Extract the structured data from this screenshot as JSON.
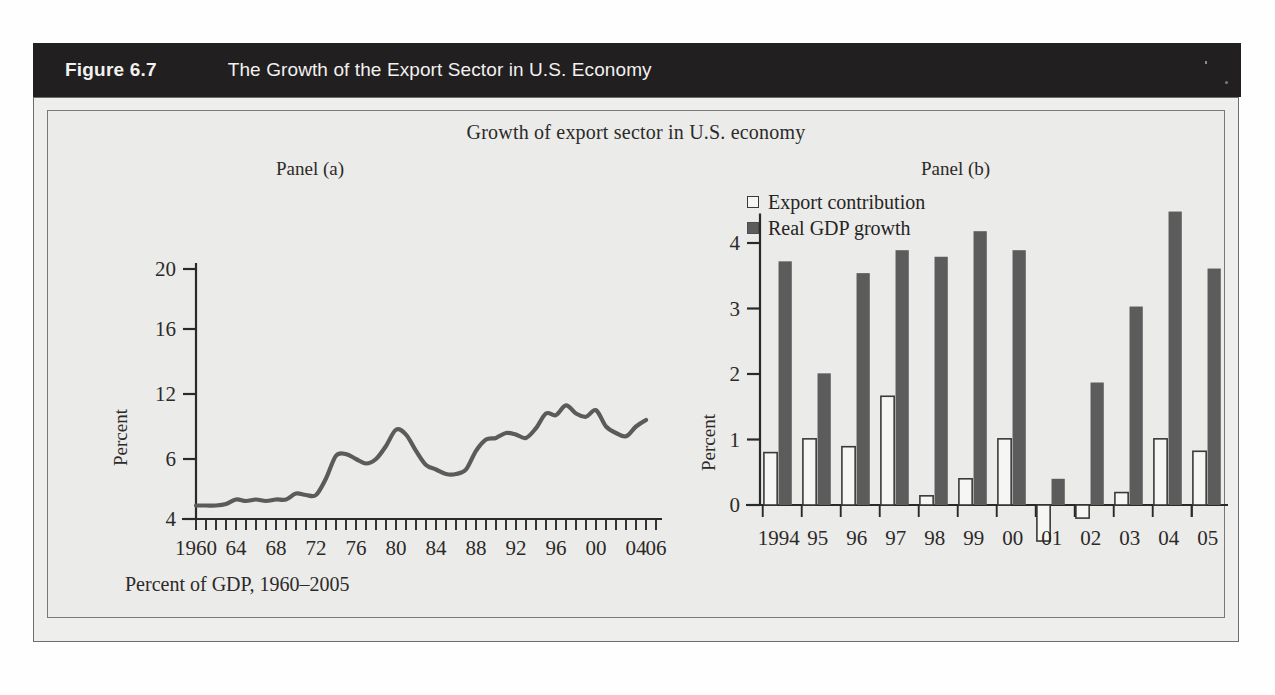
{
  "header": {
    "figure_number": "Figure 6.7",
    "title": "The Growth of the Export Sector in U.S. Economy"
  },
  "chart_title": "Growth of export sector in U.S. economy",
  "panel_a": {
    "label": "Panel (a)",
    "ylabel": "Percent",
    "caption": "Percent of GDP, 1960–2005"
  },
  "panel_b": {
    "label": "Panel (b)",
    "ylabel": "Percent",
    "legend": [
      {
        "label": "Export contribution",
        "swatch": "open-square",
        "color": "#f6f6f4"
      },
      {
        "label": "Real GDP growth",
        "swatch": "filled-square",
        "color": "#5c5c5c"
      }
    ]
  },
  "colors": {
    "header_bg": "#211f20",
    "header_text": "#f2f1ef",
    "panel_bg": "#eeeeec",
    "inner_bg": "#ebebe9",
    "frame": "#6c6d6f",
    "line": "#5b5b5b",
    "bar_dark": "#5c5c5c",
    "bar_open_fill": "#f6f6f4",
    "bar_open_stroke": "#3a3a38",
    "axis": "#2b2a28"
  },
  "chart_data": [
    {
      "type": "line",
      "title": "Panel (a) — Exports as percent of GDP",
      "xlabel": "",
      "ylabel": "Percent",
      "subcaption": "Percent of GDP, 1960–2005",
      "grid": false,
      "legend_position": "none",
      "xlim": [
        1960,
        2006
      ],
      "ylim": [
        4,
        20
      ],
      "ytick_labels": [
        "4",
        "6",
        "12",
        "16",
        "20"
      ],
      "ytick_values": [
        4,
        8,
        12,
        16,
        20
      ],
      "xtick_labels": [
        "1960",
        "64",
        "68",
        "72",
        "76",
        "80",
        "84",
        "88",
        "92",
        "96",
        "00",
        "04",
        "06"
      ],
      "xtick_values": [
        1960,
        1964,
        1968,
        1972,
        1976,
        1980,
        1984,
        1988,
        1992,
        1996,
        2000,
        2004,
        2006
      ],
      "minor_xticks_every": 1,
      "series": [
        {
          "name": "Exports as % of GDP",
          "x": [
            1960,
            1961,
            1962,
            1963,
            1964,
            1965,
            1966,
            1967,
            1968,
            1969,
            1970,
            1971,
            1972,
            1973,
            1974,
            1975,
            1976,
            1977,
            1978,
            1979,
            1980,
            1981,
            1982,
            1983,
            1984,
            1985,
            1986,
            1987,
            1988,
            1989,
            1990,
            1991,
            1992,
            1993,
            1994,
            1995,
            1996,
            1997,
            1998,
            1999,
            2000,
            2001,
            2002,
            2003,
            2004,
            2005
          ],
          "values": [
            4.9,
            4.9,
            4.9,
            5.0,
            5.3,
            5.2,
            5.3,
            5.2,
            5.3,
            5.3,
            5.7,
            5.6,
            5.6,
            6.7,
            8.2,
            8.3,
            8.0,
            7.7,
            8.0,
            8.8,
            9.8,
            9.5,
            8.5,
            7.6,
            7.3,
            7.0,
            7.0,
            7.3,
            8.5,
            9.2,
            9.3,
            9.6,
            9.5,
            9.3,
            9.9,
            10.8,
            10.7,
            11.3,
            10.8,
            10.6,
            11.0,
            10.0,
            9.6,
            9.4,
            10.0,
            10.4
          ]
        }
      ]
    },
    {
      "type": "bar",
      "title": "Panel (b) — Export contribution and real GDP growth",
      "xlabel": "",
      "ylabel": "Percent",
      "grid": false,
      "legend_position": "top-left",
      "ylim": [
        -0.7,
        4.6
      ],
      "ytick_labels": [
        "0",
        "1",
        "2",
        "3",
        "4"
      ],
      "ytick_values": [
        0,
        1,
        2,
        3,
        4
      ],
      "categories": [
        "1994",
        "95",
        "96",
        "97",
        "98",
        "99",
        "00",
        "01",
        "02",
        "03",
        "04",
        "05"
      ],
      "series": [
        {
          "name": "Export contribution",
          "style": "open",
          "values": [
            0.8,
            1.01,
            0.89,
            1.66,
            0.14,
            0.4,
            1.01,
            -0.55,
            -0.2,
            0.19,
            1.01,
            0.82
          ]
        },
        {
          "name": "Real GDP growth",
          "style": "filled",
          "values": [
            3.72,
            2.01,
            3.54,
            3.89,
            3.79,
            4.18,
            3.89,
            0.4,
            1.87,
            3.03,
            4.48,
            3.61
          ]
        }
      ]
    }
  ]
}
